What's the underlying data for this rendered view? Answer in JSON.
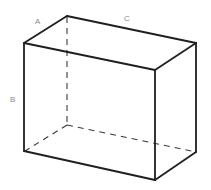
{
  "diagram": {
    "type": "rectangular-prism",
    "labels": {
      "a": "A",
      "b": "B",
      "c": "C"
    },
    "colors": {
      "visible_edge": "#1f1f1f",
      "hidden_edge": "#3a3a3a",
      "label": "#8a8a8a",
      "background": "#ffffff"
    }
  }
}
